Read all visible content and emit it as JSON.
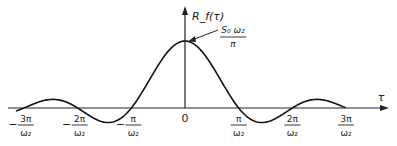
{
  "chart_data": {
    "type": "line",
    "title": "",
    "function": "R_f(tau) = (S0*w2/pi) * sin(w2*tau)/(w2*tau)",
    "ylabel": "R_f(τ)",
    "xlabel": "τ",
    "peak_label": {
      "numerator": "S₀ ω₂",
      "denominator": "π"
    },
    "x_ticks": [
      {
        "num": "3π",
        "den": "ω₂",
        "sign": "−",
        "value_over_pi_w2": -3
      },
      {
        "num": "2π",
        "den": "ω₂",
        "sign": "−",
        "value_over_pi_w2": -2
      },
      {
        "num": "π",
        "den": "ω₂",
        "sign": "−",
        "value_over_pi_w2": -1
      },
      {
        "num": "0",
        "den": "",
        "sign": "",
        "value_over_pi_w2": 0
      },
      {
        "num": "π",
        "den": "ω₂",
        "sign": "",
        "value_over_pi_w2": 1
      },
      {
        "num": "2π",
        "den": "ω₂",
        "sign": "",
        "value_over_pi_w2": 2
      },
      {
        "num": "3π",
        "den": "ω₂",
        "sign": "",
        "value_over_pi_w2": 3
      }
    ],
    "x": [
      -3,
      -2.5,
      -2,
      -1.5,
      -1,
      -0.5,
      0,
      0.5,
      1,
      1.5,
      2,
      2.5,
      3
    ],
    "values": [
      0,
      0.127,
      0,
      -0.212,
      0,
      0.637,
      1,
      0.637,
      0,
      -0.212,
      0,
      0.127,
      0
    ],
    "xlim": [
      -3.15,
      3.8
    ],
    "ylim": [
      -0.25,
      1.05
    ],
    "grid": false,
    "legend": "none"
  }
}
